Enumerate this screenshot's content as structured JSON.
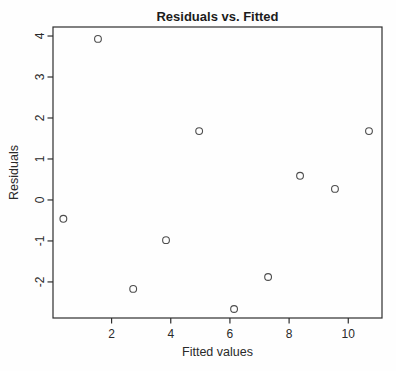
{
  "chart_data": {
    "type": "scatter",
    "title": "Residuals vs. Fitted",
    "xlabel": "Fitted values",
    "ylabel": "Residuals",
    "xlim": [
      0.02,
      11.14
    ],
    "ylim": [
      -2.88,
      4.22
    ],
    "x_ticks": [
      2,
      4,
      6,
      8,
      10
    ],
    "y_ticks": [
      -2,
      -1,
      0,
      1,
      2,
      3,
      4
    ],
    "grid": false,
    "legend": "none",
    "marker": "open-circle",
    "points": [
      {
        "x": 0.37,
        "y": -0.46
      },
      {
        "x": 1.54,
        "y": 3.93
      },
      {
        "x": 2.73,
        "y": -2.17
      },
      {
        "x": 3.84,
        "y": -0.98
      },
      {
        "x": 4.96,
        "y": 1.68
      },
      {
        "x": 6.14,
        "y": -2.66
      },
      {
        "x": 7.29,
        "y": -1.88
      },
      {
        "x": 8.37,
        "y": 0.59
      },
      {
        "x": 9.55,
        "y": 0.27
      },
      {
        "x": 10.7,
        "y": 1.68
      }
    ],
    "colors": {
      "background": "#fefefe",
      "axis": "#2e2e2e",
      "text": "#1c1c1c",
      "point_stroke": "#4d4d4d"
    }
  }
}
